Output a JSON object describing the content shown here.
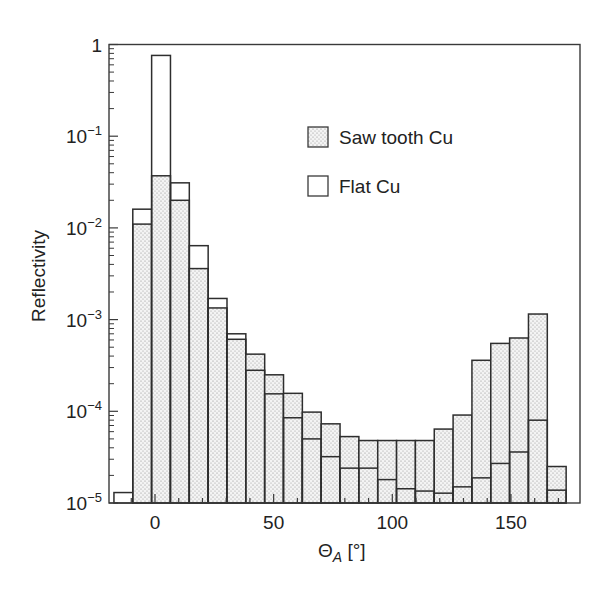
{
  "chart_data": {
    "type": "bar",
    "title": "",
    "xlabel": "Θ_A [°]",
    "xlabel_main": "Θ",
    "xlabel_sub": "A",
    "xlabel_unit": " [°]",
    "ylabel": "Reflectivity",
    "yscale": "log",
    "ylim": [
      1e-05,
      1
    ],
    "xlim": [
      -19,
      181
    ],
    "x_ticks": [
      0,
      50,
      100,
      150
    ],
    "x_minor_tick_step": 10,
    "y_ticks": [
      {
        "value": 1,
        "base": "1",
        "exp": ""
      },
      {
        "value": 0.1,
        "base": "10",
        "exp": "−1"
      },
      {
        "value": 0.01,
        "base": "10",
        "exp": "−2"
      },
      {
        "value": 0.001,
        "base": "10",
        "exp": "−3"
      },
      {
        "value": 0.0001,
        "base": "10",
        "exp": "−4"
      },
      {
        "value": 1e-05,
        "base": "10",
        "exp": "−5"
      }
    ],
    "bin_start": -17.3,
    "bin_width": 7.94,
    "categories": [
      -13.3,
      -5.4,
      2.6,
      10.5,
      18.5,
      26.4,
      34.3,
      42.3,
      50.2,
      58.1,
      66.1,
      74.0,
      82.0,
      89.9,
      97.8,
      105.8,
      113.7,
      121.6,
      129.6,
      137.5,
      145.5,
      153.4,
      161.3,
      169.3
    ],
    "series": [
      {
        "name": "Saw tooth Cu",
        "style": "dotted",
        "values": [
          null,
          0.011,
          0.037,
          0.02,
          0.0036,
          0.00134,
          0.00061,
          0.00042,
          0.00025,
          0.000157,
          9.8e-05,
          7.3e-05,
          5.3e-05,
          4.8e-05,
          4.8e-05,
          4.8e-05,
          4.8e-05,
          6.4e-05,
          9.1e-05,
          0.00036,
          0.00055,
          0.00063,
          0.00115,
          2.5e-05
        ]
      },
      {
        "name": "Flat Cu",
        "style": "outline",
        "values": [
          1.3e-05,
          0.016,
          0.76,
          0.031,
          0.0064,
          0.0017,
          0.0007,
          0.00028,
          0.000155,
          8.5e-05,
          5e-05,
          3.2e-05,
          2.4e-05,
          2.4e-05,
          1.8e-05,
          1.43e-05,
          1.35e-05,
          1.28e-05,
          1.5e-05,
          1.88e-05,
          2.7e-05,
          3.6e-05,
          8e-05,
          1.38e-05
        ]
      }
    ],
    "legend": {
      "position": "upper-right-inside",
      "entries": [
        {
          "label": "Saw tooth Cu",
          "swatch": "dotted"
        },
        {
          "label": "Flat Cu",
          "swatch": "outline"
        }
      ]
    },
    "grid": false
  },
  "colors": {
    "frame": "#3a3a3a",
    "bar_outline": "#2e2e2e",
    "dot_fill_bg": "#f4f4f4",
    "dot": "#8a8a8a"
  }
}
